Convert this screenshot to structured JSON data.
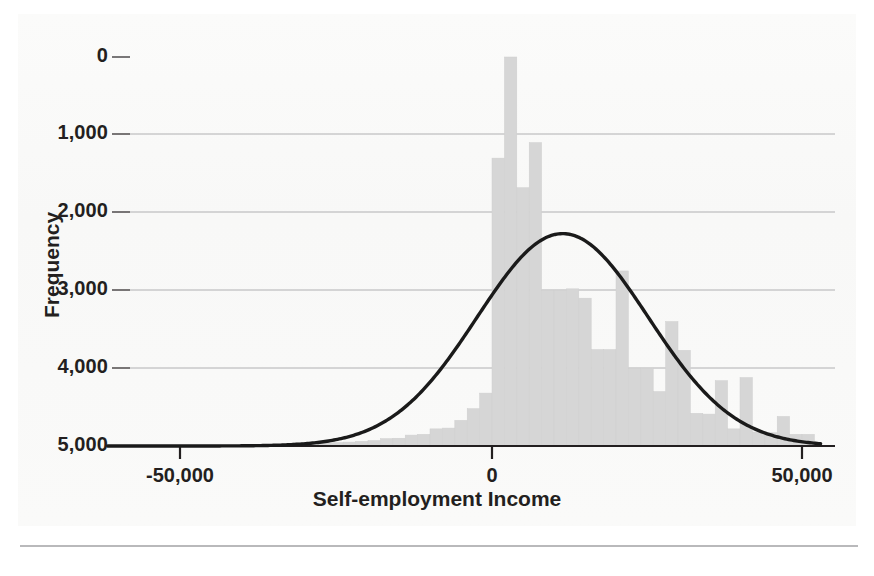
{
  "chart_data": {
    "type": "bar",
    "title": "",
    "subtitle": "",
    "xlabel": "Self-employment Income",
    "ylabel": "Frequency",
    "xlim": [
      -62000,
      55000
    ],
    "ylim": [
      0,
      5000
    ],
    "xticks": [
      -50000,
      0,
      50000
    ],
    "xtick_labels": [
      "-50,000",
      "0",
      "50,000"
    ],
    "yticks": [
      0,
      1000,
      2000,
      3000,
      4000,
      5000
    ],
    "ytick_labels": [
      "0",
      "1,000",
      "2,000",
      "3,000",
      "4,000",
      "5,000"
    ],
    "grid": "horizontal",
    "legend": "none",
    "bar_color": "#d6d6d6",
    "bar_edge_color": "#cfcfcf",
    "curve_color": "#1a1a1a",
    "axis_color": "#231f20",
    "gridline_color": "#b0b0b2",
    "bin_width": 2000,
    "bar_bins_start": -32000,
    "categories": [
      "-32,000",
      "-30,000",
      "-28,000",
      "-26,000",
      "-24,000",
      "-22,000",
      "-20,000",
      "-18,000",
      "-16,000",
      "-14,000",
      "-12,000",
      "-10,000",
      "-8,000",
      "-6,000",
      "-4,000",
      "-2,000",
      "0",
      "2,000",
      "4,000",
      "6,000",
      "8,000",
      "10,000",
      "12,000",
      "14,000",
      "16,000",
      "18,000",
      "20,000",
      "22,000",
      "24,000",
      "26,000",
      "28,000",
      "30,000",
      "32,000",
      "34,000",
      "36,000",
      "38,000",
      "40,000",
      "42,000",
      "44,000",
      "46,000",
      "48,000",
      "50,000"
    ],
    "values": [
      40,
      40,
      40,
      45,
      50,
      60,
      70,
      95,
      100,
      140,
      150,
      220,
      230,
      330,
      480,
      680,
      3700,
      5000,
      3320,
      3900,
      2000,
      2000,
      2020,
      1900,
      1240,
      1240,
      2250,
      1000,
      1000,
      700,
      1600,
      1230,
      420,
      410,
      840,
      220,
      880,
      180,
      170,
      380,
      150,
      150
    ],
    "curve": {
      "kind": "normal-overlay",
      "mean": 11400,
      "peak_value": 2730,
      "peak_x": 11400,
      "std_dev": 13800,
      "domain": [
        -62000,
        53000
      ]
    }
  },
  "axes": {
    "ytick_positions_px": [
      57,
      134,
      212,
      290,
      368,
      446
    ],
    "xtick_positions_px": [
      180,
      492,
      802
    ],
    "plot_left_px": 130,
    "plot_right_px": 835,
    "baseline_px": 446
  }
}
